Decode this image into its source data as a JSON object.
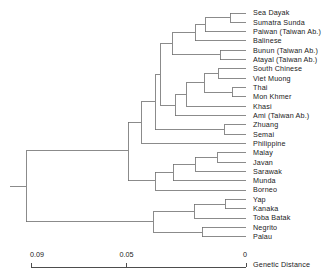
{
  "chart_data": {
    "type": "dendrogram",
    "title": "",
    "xlabel": "Genetic Distance",
    "ylabel": "",
    "axis": {
      "orientation": "horizontal-reversed",
      "ticks": [
        {
          "value": "0.09",
          "pos": 0.09
        },
        {
          "value": "0.05",
          "pos": 0.05
        },
        {
          "value": "0",
          "pos": 0.0
        }
      ],
      "xlim": [
        0.09,
        0.0
      ],
      "grid": false,
      "caption": "Genetic Distance"
    },
    "leaves": [
      {
        "label": "Sea Dayak",
        "row": 0
      },
      {
        "label": "Sumatra  Sunda",
        "row": 1
      },
      {
        "label": "Paiwan  (Taiwan Ab.)",
        "row": 2
      },
      {
        "label": "Balinese",
        "row": 3
      },
      {
        "label": "Bunun  (Taiwan Ab.)",
        "row": 4
      },
      {
        "label": "Atayal  (Taiwan Ab.)",
        "row": 5
      },
      {
        "label": "South  Chinese",
        "row": 6
      },
      {
        "label": "Viet Muong",
        "row": 7
      },
      {
        "label": "Thai",
        "row": 8
      },
      {
        "label": "Mon Khmer",
        "row": 9
      },
      {
        "label": "Khasi",
        "row": 10
      },
      {
        "label": "Ami (Taiwan Ab.)",
        "row": 11
      },
      {
        "label": "Zhuang",
        "row": 12
      },
      {
        "label": "Semai",
        "row": 13
      },
      {
        "label": "Philippine",
        "row": 14
      },
      {
        "label": "Malay",
        "row": 15
      },
      {
        "label": "Javan",
        "row": 16
      },
      {
        "label": "Sarawak",
        "row": 17
      },
      {
        "label": "Munda",
        "row": 18
      },
      {
        "label": "Borneo",
        "row": 19
      },
      {
        "label": "Yap",
        "row": 20
      },
      {
        "label": "Kanaka",
        "row": 21
      },
      {
        "label": "Toba Batak",
        "row": 22
      },
      {
        "label": "Negrito",
        "row": 23
      },
      {
        "label": "Palau",
        "row": 24
      }
    ],
    "merges": [
      {
        "name": "sea-dayak+sumatra-sunda",
        "x": 230,
        "children_rows": [
          0,
          1
        ]
      },
      {
        "name": "+paiwan",
        "x": 205,
        "children_rows": [
          0.5,
          2
        ]
      },
      {
        "name": "+balinese",
        "x": 195,
        "children_rows": [
          1.25,
          3
        ]
      },
      {
        "name": "bunun+atayal",
        "x": 220,
        "children_rows": [
          4,
          5
        ]
      },
      {
        "name": "austronesian-core",
        "x": 172,
        "children_rows": [
          2.125,
          4.5
        ]
      },
      {
        "name": "south-chinese+viet-muong",
        "x": 218,
        "children_rows": [
          6,
          7
        ]
      },
      {
        "name": "thai+mon-khmer",
        "x": 232,
        "children_rows": [
          8,
          9
        ]
      },
      {
        "name": "chinese+tai",
        "x": 204,
        "children_rows": [
          6.5,
          8.5
        ]
      },
      {
        "name": "+khasi",
        "x": 186,
        "children_rows": [
          7.5,
          10
        ]
      },
      {
        "name": "+ami",
        "x": 175,
        "children_rows": [
          8.75,
          11
        ]
      },
      {
        "name": "asian-clade",
        "x": 160,
        "children_rows": [
          3.3,
          9.9
        ]
      },
      {
        "name": "zhuang+semai",
        "x": 224,
        "children_rows": [
          12,
          13
        ]
      },
      {
        "name": "+zhuang-semai",
        "x": 155,
        "children_rows": [
          6.6,
          12.5
        ]
      },
      {
        "name": "+philippine",
        "x": 141,
        "children_rows": [
          9.5,
          14
        ]
      },
      {
        "name": "malay+javan",
        "x": 217,
        "children_rows": [
          15,
          16
        ]
      },
      {
        "name": "+sarawak",
        "x": 195,
        "children_rows": [
          15.5,
          17
        ]
      },
      {
        "name": "+munda",
        "x": 173,
        "children_rows": [
          16.25,
          18
        ]
      },
      {
        "name": "+borneo",
        "x": 155,
        "children_rows": [
          17.1,
          19
        ]
      },
      {
        "name": "western-austronesian-join",
        "x": 128,
        "children_rows": [
          11.7,
          18.0
        ]
      },
      {
        "name": "yap+kanaka",
        "x": 225,
        "children_rows": [
          20,
          21
        ]
      },
      {
        "name": "+toba-batak",
        "x": 194,
        "children_rows": [
          20.5,
          22
        ]
      },
      {
        "name": "negrito+palau",
        "x": 202,
        "children_rows": [
          23,
          24
        ]
      },
      {
        "name": "oceanic-clade",
        "x": 153,
        "children_rows": [
          21.3,
          23.5
        ]
      },
      {
        "name": "root",
        "x": 26,
        "children_rows": [
          14.8,
          22.4
        ]
      }
    ]
  },
  "figure": {
    "line_color": "#6e6e6e",
    "text_color": "#1a1a1a",
    "background": "#ffffff"
  }
}
